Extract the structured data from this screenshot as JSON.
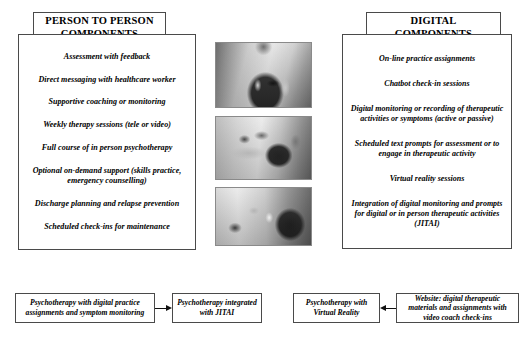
{
  "figure": {
    "left_header": {
      "line1": "PERSON TO PERSON",
      "line2": "COMPONENTS"
    },
    "right_header": {
      "line1": "DIGITAL",
      "line2": "COMPONENTS"
    },
    "person_to_person_components": [
      "Assessment with feedback",
      "Direct messaging with healthcare worker",
      "Supportive coaching or monitoring",
      "Weekly therapy sessions (tele or video)",
      "Full course of in person psychotherapy",
      "Optional on-demand support (skills practice, emergency counselling)",
      "Discharge planning and relapse prevention",
      "Scheduled check-ins for maintenance"
    ],
    "digital_components": [
      "On-line practice assignments",
      "Chatbot check-in sessions",
      "Digital monitoring or recording of therapeutic activities or symptoms (active or passive)",
      "Scheduled text prompts for assessment or to engage in therapeutic activity",
      "Virtual reality sessions",
      "Integration of  digital monitoring and prompts for digital or in person therapeutic activities (JITAI)"
    ],
    "photos": [
      {
        "name": "photo-person-using-smartphone",
        "caption": "Person standing and using a smartphone"
      },
      {
        "name": "photo-person-at-desk-with-tablet",
        "caption": "Person seated at a desk reaching toward a tablet"
      },
      {
        "name": "photo-person-at-laptop",
        "caption": "Person seated at a laptop computer"
      }
    ],
    "flow": {
      "boxes": [
        "Psychotherapy with digital practice assignments and symptom monitoring",
        "Psychotherapy integrated with JITAI",
        "Psychotherapy with Virtual Reality",
        "Website: digital therapeutic materials and assignments with video coach check-ins"
      ],
      "arrows": [
        {
          "name": "arrow-flow1-to-flow2",
          "direction": "right"
        },
        {
          "name": "arrow-flow4-to-flow3",
          "direction": "left"
        }
      ]
    },
    "colors": {
      "border": "#4a4a4a",
      "text": "#000000",
      "background": "#ffffff",
      "arrow": "#111111"
    }
  }
}
